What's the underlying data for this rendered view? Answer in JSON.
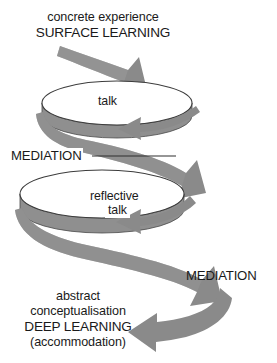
{
  "diagram": {
    "colors": {
      "ribbon_fill": "#8a8a8a",
      "ribbon_shade": "#7b7b7b",
      "disc_top": "#ffffff",
      "disc_rim": "#8f8f8f",
      "outline": "#3c3c3c",
      "text": "#1a1a1a",
      "background": "#ffffff"
    },
    "labels": {
      "top_line1": "concrete experience",
      "top_line2": "SURFACE LEARNING",
      "talk_first": "talk",
      "mediation_first": "MEDIATION",
      "reflective": "reflective",
      "talk_second": "talk",
      "mediation_second": "MEDIATION",
      "bottom_line1": "abstract",
      "bottom_line2": "conceptualisation",
      "bottom_line3": "DEEP LEARNING",
      "bottom_line4": "(accommodation)"
    },
    "elements": {
      "disc_upper_name": "talk-cycle-disc",
      "disc_lower_name": "reflective-talk-cycle-disc",
      "arrow_entry_name": "surface-learning-entry-arrow",
      "arrow_spiral_name": "mediation-spiral-ribbon",
      "arrow_exit_name": "deep-learning-exit-arrow",
      "leader_line_name": "mediation-leader-line"
    }
  }
}
